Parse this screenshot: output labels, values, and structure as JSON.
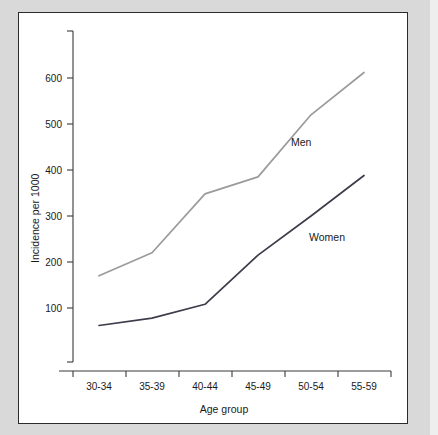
{
  "chart_data": {
    "type": "line",
    "title": "",
    "xlabel": "Age group",
    "ylabel": "Incidence per 1000",
    "categories": [
      "30-34",
      "35-39",
      "40-44",
      "45-49",
      "50-54",
      "55-59"
    ],
    "ylim": [
      0,
      680
    ],
    "yticks": [
      100,
      200,
      300,
      400,
      500,
      600
    ],
    "ytick_labels": [
      "100",
      "200",
      "300",
      "400",
      "500",
      "600"
    ],
    "grid": false,
    "legend_position": "inline-annotation",
    "series": [
      {
        "name": "Men",
        "color": "#9b9b9b",
        "values": [
          170,
          220,
          348,
          385,
          520,
          612
        ],
        "annotation": "Men"
      },
      {
        "name": "Women",
        "color": "#3c3c4a",
        "values": [
          62,
          78,
          108,
          215,
          300,
          388
        ],
        "annotation": "Women"
      }
    ]
  },
  "figure": {
    "background": "#ffffff",
    "page_background": "#d9d9d9",
    "border_color": "#2b2b2b"
  },
  "axis": {
    "y_title": "Incidence per 1000",
    "x_title": "Age group"
  }
}
